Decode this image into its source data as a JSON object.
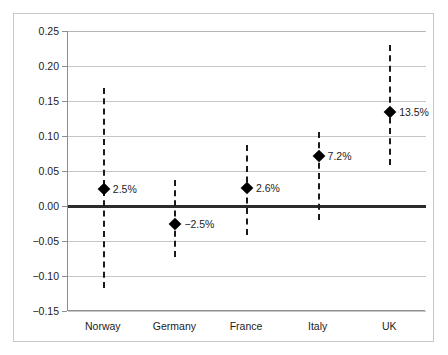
{
  "chart_data": {
    "type": "scatter",
    "title": "",
    "subtitle": "",
    "xlabel": "",
    "ylabel": "",
    "categories": [
      "Norway",
      "Germany",
      "France",
      "Italy",
      "UK"
    ],
    "values": [
      0.025,
      -0.025,
      0.026,
      0.072,
      0.135
    ],
    "data_labels": [
      "2.5%",
      "−2.5%",
      "2.6%",
      "7.2%",
      "13.5%"
    ],
    "error_high": [
      0.168,
      0.037,
      0.087,
      0.106,
      0.23
    ],
    "error_low": [
      -0.117,
      -0.073,
      -0.041,
      -0.02,
      0.059
    ],
    "ylim": [
      -0.15,
      0.25
    ],
    "ytick_values": [
      0.25,
      0.2,
      0.15,
      0.1,
      0.05,
      0.0,
      -0.05,
      -0.1,
      -0.15
    ],
    "ytick_labels": [
      "0.25",
      "0.20",
      "0.15",
      "0.10",
      "0.05",
      "0.00",
      "−0.05",
      "−0.10",
      "−0.15"
    ],
    "grid": true,
    "legend": null,
    "zero_reference_line": 0.0,
    "marker_style": "diamond",
    "errorbar_style": "dashed",
    "colors": {
      "marker": "#000000",
      "errorbar": "#1a1a1a",
      "gridline": "#c6c6c6",
      "axis": "#8e8e8e",
      "zeroline": "#2b2b2b",
      "frame": "#c9c9c9",
      "background": "#ffffff",
      "text": "#1c1c1c"
    }
  }
}
